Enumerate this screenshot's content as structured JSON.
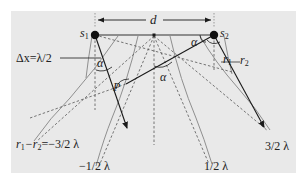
{
  "figure": {
    "background_panel_color": "#e9e9e9",
    "line_color": "#1a1a1a",
    "gray_line_color": "#8a8a8a",
    "dash_color": "#555555"
  },
  "labels": {
    "source1": "s",
    "source1_sub": "1",
    "source2": "s",
    "source2_sub": "2",
    "separation": "d",
    "delta_x": "Δx=λ/2",
    "angle_alpha": "α",
    "point": "P",
    "path1": "r",
    "path1_sub": "1",
    "path2": "r",
    "path2_sub": "2",
    "order_minus_3_2_prefix": "r",
    "order_minus_3_2_sub1": "1",
    "order_minus_3_2_mid": "−r",
    "order_minus_3_2_sub2": "2",
    "order_minus_3_2_value": "=−3/2 λ",
    "order_minus_1_2": "−1/2 λ",
    "order_plus_1_2": "1/2 λ",
    "order_plus_3_2": "3/2 λ"
  }
}
